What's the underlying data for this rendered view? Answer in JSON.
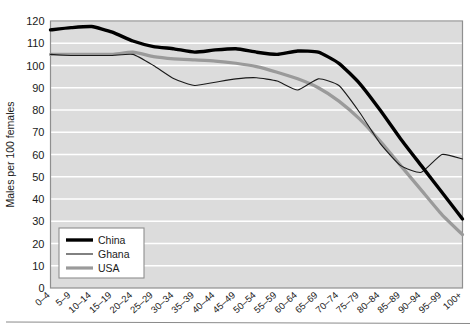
{
  "chart_data": {
    "type": "line",
    "title": "",
    "xlabel": "",
    "ylabel": "Males per 100 females",
    "ylim": [
      0,
      120
    ],
    "ytick_step": 10,
    "yticks": [
      0,
      10,
      20,
      30,
      40,
      50,
      60,
      70,
      80,
      90,
      100,
      110,
      120
    ],
    "grid": true,
    "grid_axis": "y",
    "grid_color": "#ffffff",
    "plot_background": "#dcdcdc",
    "legend_position": "lower-left",
    "categories": [
      "0–4",
      "5–9",
      "10–14",
      "15–19",
      "20–24",
      "25–29",
      "30–34",
      "35–39",
      "40–44",
      "45–49",
      "50–54",
      "55–59",
      "60–64",
      "65–69",
      "70–74",
      "75–79",
      "80–84",
      "85–89",
      "90–94",
      "95–99",
      "100+"
    ],
    "series": [
      {
        "name": "China",
        "color": "#000000",
        "width": 3.4,
        "values": [
          116,
          117,
          117.5,
          115,
          111,
          108.5,
          107.5,
          106,
          107,
          107.5,
          106,
          105,
          106.5,
          106,
          101,
          92,
          80,
          67,
          55,
          43,
          31
        ]
      },
      {
        "name": "Ghana",
        "color": "#1a1a1a",
        "width": 1.1,
        "values": [
          105,
          104.5,
          104.5,
          104.5,
          105,
          100,
          94,
          91,
          92.5,
          94,
          94.5,
          93,
          89,
          94,
          91,
          79,
          65,
          55,
          52,
          60,
          58
        ]
      },
      {
        "name": "USA",
        "color": "#9a9a9a",
        "width": 3.2,
        "values": [
          105,
          105,
          105,
          105,
          106,
          104,
          103,
          102.5,
          102,
          101,
          99.5,
          97,
          94,
          90,
          84,
          76,
          66,
          55,
          44,
          33,
          24
        ]
      }
    ]
  },
  "legend": {
    "items": [
      {
        "label": "China"
      },
      {
        "label": "Ghana"
      },
      {
        "label": "USA"
      }
    ]
  }
}
